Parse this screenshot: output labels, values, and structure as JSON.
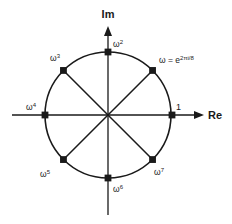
{
  "figure": {
    "background_color": "#ffffff",
    "stroke_color": "#1a1a1a",
    "axes": {
      "real": {
        "label": "Re",
        "label_x": 208,
        "label_y": 119,
        "line_x1": 12,
        "line_x2": 194,
        "y": 115
      },
      "imaginary": {
        "label": "Im",
        "label_x": 108,
        "label_y": 18,
        "line_y1": 215,
        "line_y2": 30,
        "x": 108
      }
    },
    "circle": {
      "center_x": 108,
      "center_y": 115,
      "radius": 63
    },
    "chords": [
      {
        "name": "chord-w1-w5",
        "angle_deg": 45
      },
      {
        "name": "chord-w3-w7",
        "angle_deg": 135
      }
    ],
    "points": [
      {
        "id": "w0",
        "label": "1",
        "base": "1",
        "exponent": "",
        "angle_deg": 0,
        "label_x": 176,
        "label_y": 110,
        "anchor": "start"
      },
      {
        "id": "w1",
        "label": "ω = e2πi/8",
        "base": "ω = e",
        "exponent": "2πi/8",
        "angle_deg": 45,
        "label_x": 159,
        "label_y": 63,
        "anchor": "start"
      },
      {
        "id": "w2",
        "label": "ω2",
        "base": "ω",
        "exponent": "2",
        "angle_deg": 90,
        "label_x": 113,
        "label_y": 47,
        "anchor": "start"
      },
      {
        "id": "w3",
        "label": "ω3",
        "base": "ω",
        "exponent": "3",
        "angle_deg": 135,
        "label_x": 50,
        "label_y": 61,
        "anchor": "start"
      },
      {
        "id": "w4",
        "label": "ω4",
        "base": "ω",
        "exponent": "4",
        "angle_deg": 180,
        "label_x": 26,
        "label_y": 110,
        "anchor": "start"
      },
      {
        "id": "w5",
        "label": "ω5",
        "base": "ω",
        "exponent": "5",
        "angle_deg": 225,
        "label_x": 40,
        "label_y": 177,
        "anchor": "start"
      },
      {
        "id": "w6",
        "label": "ω6",
        "base": "ω",
        "exponent": "6",
        "angle_deg": 270,
        "label_x": 113,
        "label_y": 192,
        "anchor": "start"
      },
      {
        "id": "w7",
        "label": "ω7",
        "base": "ω",
        "exponent": "7",
        "angle_deg": 315,
        "label_x": 154,
        "label_y": 175,
        "anchor": "start"
      }
    ]
  }
}
